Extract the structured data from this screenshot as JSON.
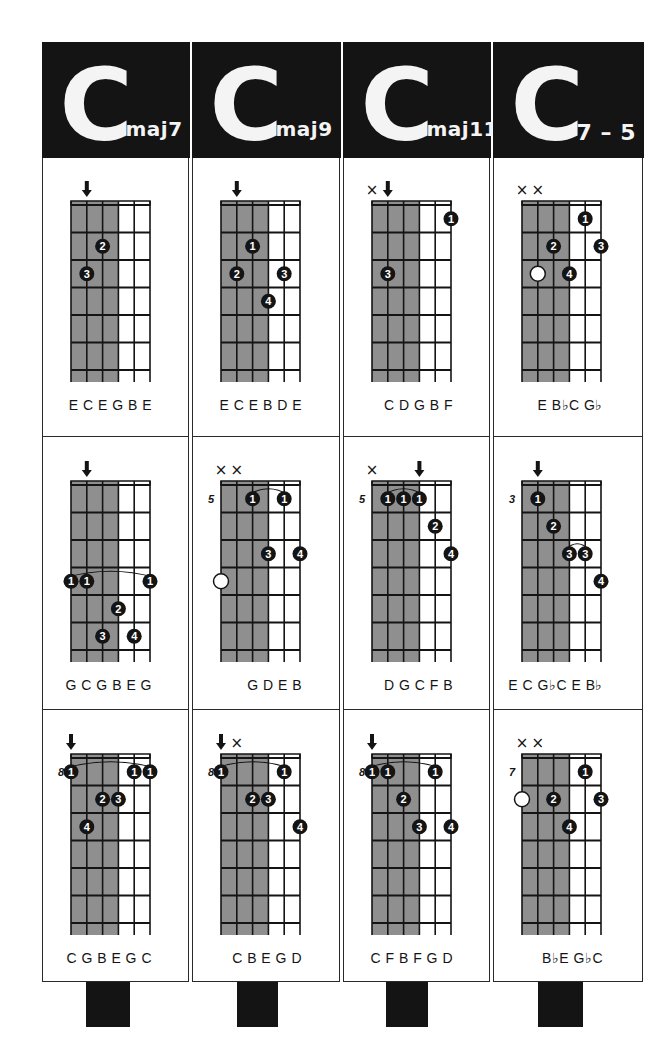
{
  "colors": {
    "ink": "#141414",
    "shade": "#8f8f8f",
    "paper": "#ffffff"
  },
  "chords": [
    {
      "root": "C",
      "suffix": "maj7",
      "voicings": [
        {
          "base_fret": "",
          "arrows": [
            1
          ],
          "muted": [],
          "barres": [],
          "dots": [
            {
              "s": 2,
              "f": 2,
              "n": "2"
            },
            {
              "s": 1,
              "f": 3,
              "n": "3"
            }
          ],
          "open_dots": [],
          "notes": "E C E G B E"
        },
        {
          "base_fret": "",
          "arrows": [
            1
          ],
          "muted": [],
          "barres": [
            {
              "from": 0,
              "to": 5,
              "f": 4
            }
          ],
          "dots": [
            {
              "s": 0,
              "f": 4,
              "n": "1"
            },
            {
              "s": 1,
              "f": 4,
              "n": "1"
            },
            {
              "s": 5,
              "f": 4,
              "n": "1"
            },
            {
              "s": 3,
              "f": 5,
              "n": "2"
            },
            {
              "s": 2,
              "f": 6,
              "n": "3"
            },
            {
              "s": 4,
              "f": 6,
              "n": "4"
            }
          ],
          "open_dots": [],
          "notes": "G C G B E G"
        },
        {
          "base_fret": "8",
          "arrows": [
            0
          ],
          "muted": [],
          "barres": [
            {
              "from": 0,
              "to": 5,
              "f": 1
            }
          ],
          "dots": [
            {
              "s": 0,
              "f": 1,
              "n": "1"
            },
            {
              "s": 4,
              "f": 1,
              "n": "1"
            },
            {
              "s": 5,
              "f": 1,
              "n": "1"
            },
            {
              "s": 2,
              "f": 2,
              "n": "2"
            },
            {
              "s": 3,
              "f": 2,
              "n": "3"
            },
            {
              "s": 1,
              "f": 3,
              "n": "4"
            }
          ],
          "open_dots": [],
          "notes": "C G B E G C"
        }
      ]
    },
    {
      "root": "C",
      "suffix": "maj9",
      "voicings": [
        {
          "base_fret": "",
          "arrows": [
            1
          ],
          "muted": [],
          "barres": [],
          "dots": [
            {
              "s": 2,
              "f": 2,
              "n": "1"
            },
            {
              "s": 1,
              "f": 3,
              "n": "2"
            },
            {
              "s": 4,
              "f": 3,
              "n": "3"
            },
            {
              "s": 3,
              "f": 4,
              "n": "4"
            }
          ],
          "open_dots": [],
          "notes": "E C E B D E"
        },
        {
          "base_fret": "5",
          "arrows": [],
          "muted": [
            0,
            1
          ],
          "barres": [
            {
              "from": 2,
              "to": 4,
              "f": 1
            }
          ],
          "dots": [
            {
              "s": 2,
              "f": 1,
              "n": "1"
            },
            {
              "s": 4,
              "f": 1,
              "n": "1"
            },
            {
              "s": 3,
              "f": 3,
              "n": "3"
            },
            {
              "s": 5,
              "f": 3,
              "n": "4"
            }
          ],
          "open_dots": [
            {
              "s": 0,
              "f": 4
            }
          ],
          "notes": "G D E B"
        },
        {
          "base_fret": "8",
          "arrows": [
            0
          ],
          "muted": [
            1
          ],
          "barres": [
            {
              "from": 0,
              "to": 4,
              "f": 1
            }
          ],
          "dots": [
            {
              "s": 0,
              "f": 1,
              "n": "1"
            },
            {
              "s": 4,
              "f": 1,
              "n": "1"
            },
            {
              "s": 2,
              "f": 2,
              "n": "2"
            },
            {
              "s": 3,
              "f": 2,
              "n": "3"
            },
            {
              "s": 5,
              "f": 3,
              "n": "4"
            }
          ],
          "open_dots": [],
          "notes": "C   B E G D"
        }
      ]
    },
    {
      "root": "C",
      "suffix": "maj11",
      "voicings": [
        {
          "base_fret": "",
          "arrows": [
            1
          ],
          "muted": [
            0
          ],
          "barres": [],
          "dots": [
            {
              "s": 5,
              "f": 1,
              "n": "1"
            },
            {
              "s": 1,
              "f": 3,
              "n": "3"
            }
          ],
          "open_dots": [],
          "notes": "C D G B F"
        },
        {
          "base_fret": "5",
          "arrows": [
            3
          ],
          "muted": [
            0
          ],
          "barres": [
            {
              "from": 1,
              "to": 3,
              "f": 1
            }
          ],
          "dots": [
            {
              "s": 1,
              "f": 1,
              "n": "1"
            },
            {
              "s": 2,
              "f": 1,
              "n": "1"
            },
            {
              "s": 3,
              "f": 1,
              "n": "1"
            },
            {
              "s": 4,
              "f": 2,
              "n": "2"
            },
            {
              "s": 5,
              "f": 3,
              "n": "4"
            }
          ],
          "open_dots": [],
          "notes": "D G C F B"
        },
        {
          "base_fret": "8",
          "arrows": [
            0
          ],
          "muted": [],
          "barres": [
            {
              "from": 0,
              "to": 4,
              "f": 1
            }
          ],
          "dots": [
            {
              "s": 0,
              "f": 1,
              "n": "1"
            },
            {
              "s": 1,
              "f": 1,
              "n": "1"
            },
            {
              "s": 4,
              "f": 1,
              "n": "1"
            },
            {
              "s": 2,
              "f": 2,
              "n": "2"
            },
            {
              "s": 3,
              "f": 3,
              "n": "3"
            },
            {
              "s": 5,
              "f": 3,
              "n": "4"
            }
          ],
          "open_dots": [],
          "notes": "C F B F G D"
        }
      ]
    },
    {
      "root": "C",
      "suffix": "7 – 5",
      "voicings": [
        {
          "base_fret": "",
          "arrows": [],
          "muted": [
            0,
            1
          ],
          "barres": [],
          "dots": [
            {
              "s": 4,
              "f": 1,
              "n": "1"
            },
            {
              "s": 2,
              "f": 2,
              "n": "2"
            },
            {
              "s": 5,
              "f": 2,
              "n": "3"
            },
            {
              "s": 3,
              "f": 3,
              "n": "4"
            }
          ],
          "open_dots": [
            {
              "s": 1,
              "f": 3
            }
          ],
          "notes": "E B♭C G♭"
        },
        {
          "base_fret": "3",
          "arrows": [
            1
          ],
          "muted": [],
          "barres": [
            {
              "from": 3,
              "to": 4,
              "f": 3
            }
          ],
          "dots": [
            {
              "s": 1,
              "f": 1,
              "n": "1"
            },
            {
              "s": 2,
              "f": 2,
              "n": "2"
            },
            {
              "s": 3,
              "f": 3,
              "n": "3"
            },
            {
              "s": 4,
              "f": 3,
              "n": "3"
            },
            {
              "s": 5,
              "f": 4,
              "n": "4"
            }
          ],
          "open_dots": [],
          "notes": "E C G♭C E B♭"
        },
        {
          "base_fret": "7",
          "arrows": [],
          "muted": [
            0,
            1
          ],
          "barres": [],
          "dots": [
            {
              "s": 4,
              "f": 1,
              "n": "1"
            },
            {
              "s": 2,
              "f": 2,
              "n": "2"
            },
            {
              "s": 5,
              "f": 2,
              "n": "3"
            },
            {
              "s": 3,
              "f": 3,
              "n": "4"
            }
          ],
          "open_dots": [
            {
              "s": 0,
              "f": 2
            }
          ],
          "notes": "B♭E G♭C"
        }
      ]
    }
  ]
}
